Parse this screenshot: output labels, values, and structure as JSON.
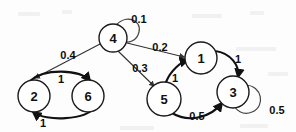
{
  "diagram": {
    "background_color": "#fdfdfd",
    "node_fill": "#ffffff",
    "stroke_color": "#111111",
    "nodes": [
      {
        "id": "4",
        "label": "4",
        "cx": 113,
        "cy": 38,
        "r": 14
      },
      {
        "id": "2",
        "label": "2",
        "cx": 34,
        "cy": 96,
        "r": 16
      },
      {
        "id": "6",
        "label": "6",
        "cx": 88,
        "cy": 96,
        "r": 16
      },
      {
        "id": "1",
        "label": "1",
        "cx": 201,
        "cy": 58,
        "r": 16
      },
      {
        "id": "5",
        "label": "5",
        "cx": 164,
        "cy": 99,
        "r": 17
      },
      {
        "id": "3",
        "label": "3",
        "cx": 233,
        "cy": 92,
        "r": 16
      }
    ],
    "edges": [
      {
        "id": "e-4-4",
        "from": "4",
        "to": "4",
        "label": "0.1",
        "label_x": 139,
        "label_y": 19,
        "kind": "self-loop"
      },
      {
        "id": "e-4-2",
        "from": "4",
        "to": "2",
        "label": "0.4",
        "label_x": 68,
        "label_y": 55,
        "kind": "straight"
      },
      {
        "id": "e-4-1",
        "from": "4",
        "to": "1",
        "label": "0.2",
        "label_x": 160,
        "label_y": 47,
        "kind": "straight"
      },
      {
        "id": "e-4-5",
        "from": "4",
        "to": "5",
        "label": "0.3",
        "label_x": 140,
        "label_y": 68,
        "kind": "straight"
      },
      {
        "id": "e-2-6",
        "from": "2",
        "to": "6",
        "label": "1",
        "label_x": 61,
        "label_y": 79,
        "kind": "curve"
      },
      {
        "id": "e-6-2",
        "from": "6",
        "to": "2",
        "label": "1",
        "label_x": 43,
        "label_y": 123,
        "kind": "curve"
      },
      {
        "id": "e-5-1",
        "from": "5",
        "to": "1",
        "label": "1",
        "label_x": 175,
        "label_y": 78,
        "kind": "curve"
      },
      {
        "id": "e-1-3",
        "from": "1",
        "to": "3",
        "label": "1",
        "label_x": 238,
        "label_y": 59,
        "kind": "curve"
      },
      {
        "id": "e-5-3",
        "from": "5",
        "to": "3",
        "label": "0.5",
        "label_x": 197,
        "label_y": 116,
        "kind": "curve"
      },
      {
        "id": "e-3-3",
        "from": "3",
        "to": "3",
        "label": "0.5",
        "label_x": 277,
        "label_y": 110,
        "kind": "self-loop"
      }
    ]
  }
}
